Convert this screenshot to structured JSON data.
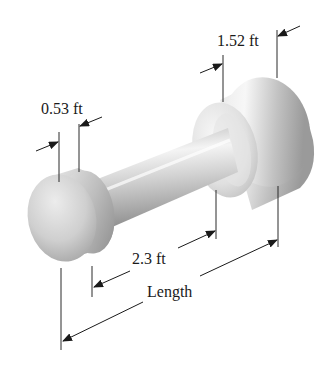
{
  "diagram": {
    "type": "engineering-dimension-drawing",
    "labels": {
      "small_end_width": "0.53 ft",
      "large_end_width": "1.52 ft",
      "shaft_span": "2.3 ft",
      "overall": "Length"
    },
    "colors": {
      "background": "#ffffff",
      "line": "#1a1a1a",
      "metal_light": "#f2f2f2",
      "metal_mid": "#c8c8c8",
      "metal_dark": "#8e8e8e"
    }
  }
}
